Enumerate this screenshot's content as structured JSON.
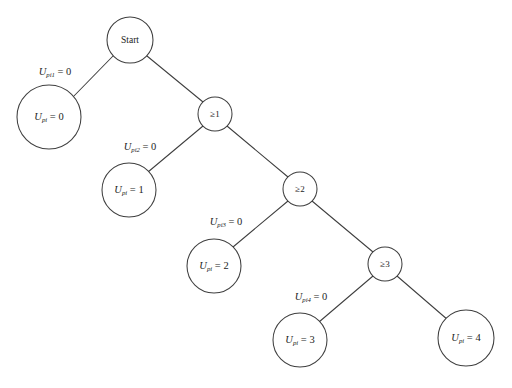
{
  "diagram": {
    "type": "decision-tree",
    "title": "",
    "background_color": "#ffffff",
    "stroke_color": "#3f3f3f",
    "text_color": "#1d1d1d",
    "root": {
      "id": "start",
      "label": "Start",
      "shape": "circle",
      "cx": 130,
      "cy": 40,
      "r": 23
    },
    "decision_nodes": [
      {
        "id": "ge1",
        "label": "≥1",
        "shape": "circle",
        "cx": 215,
        "cy": 114,
        "r": 17
      },
      {
        "id": "ge2",
        "label": "≥2",
        "shape": "circle",
        "cx": 300,
        "cy": 189,
        "r": 17
      },
      {
        "id": "ge3",
        "label": "≥3",
        "shape": "circle",
        "cx": 385,
        "cy": 264,
        "r": 17
      }
    ],
    "terminal_nodes": [
      {
        "id": "t0",
        "variable": "U",
        "subscript": "pi",
        "equals": " = 0",
        "value": "0",
        "shape": "circle",
        "cx": 49,
        "cy": 117,
        "r": 32
      },
      {
        "id": "t1",
        "variable": "U",
        "subscript": "pi",
        "equals": " = 1",
        "value": "1",
        "shape": "circle",
        "cx": 129,
        "cy": 190,
        "r": 27
      },
      {
        "id": "t2",
        "variable": "U",
        "subscript": "pi",
        "equals": " = 2",
        "value": "2",
        "shape": "circle",
        "cx": 214,
        "cy": 266,
        "r": 27
      },
      {
        "id": "t3",
        "variable": "U",
        "subscript": "pi",
        "equals": " = 3",
        "value": "3",
        "shape": "circle",
        "cx": 300,
        "cy": 340,
        "r": 27
      },
      {
        "id": "t4",
        "variable": "U",
        "subscript": "pi",
        "equals": " = 4",
        "value": "4",
        "shape": "circle",
        "cx": 466,
        "cy": 338,
        "r": 28
      }
    ],
    "edges": [
      {
        "id": "e-start-t0",
        "from": "start",
        "to": "t0",
        "x1": 113,
        "y1": 56,
        "x2": 72,
        "y2": 98
      },
      {
        "id": "e-start-ge1",
        "from": "start",
        "to": "ge1",
        "x1": 147,
        "y1": 56,
        "x2": 203,
        "y2": 102
      },
      {
        "id": "e-ge1-t1",
        "from": "ge1",
        "to": "t1",
        "x1": 203,
        "y1": 126,
        "x2": 148,
        "y2": 172
      },
      {
        "id": "e-ge1-ge2",
        "from": "ge1",
        "to": "ge2",
        "x1": 227,
        "y1": 126,
        "x2": 288,
        "y2": 177
      },
      {
        "id": "e-ge2-t2",
        "from": "ge2",
        "to": "t2",
        "x1": 288,
        "y1": 201,
        "x2": 233,
        "y2": 247
      },
      {
        "id": "e-ge2-ge3",
        "from": "ge2",
        "to": "ge3",
        "x1": 312,
        "y1": 201,
        "x2": 373,
        "y2": 252
      },
      {
        "id": "e-ge3-t3",
        "from": "ge3",
        "to": "t3",
        "x1": 373,
        "y1": 276,
        "x2": 319,
        "y2": 322
      },
      {
        "id": "e-ge3-t4",
        "from": "ge3",
        "to": "t4",
        "x1": 397,
        "y1": 276,
        "x2": 448,
        "y2": 320
      }
    ],
    "edge_labels": [
      {
        "id": "el1",
        "for_edge": "e-start-t0",
        "variable": "U",
        "subscript": "pi1",
        "equals": " = 0",
        "x": 55,
        "y": 73
      },
      {
        "id": "el2",
        "for_edge": "e-ge1-t1",
        "variable": "U",
        "subscript": "pi2",
        "equals": " = 0",
        "x": 140,
        "y": 148
      },
      {
        "id": "el3",
        "for_edge": "e-ge2-t2",
        "variable": "U",
        "subscript": "pi3",
        "equals": " = 0",
        "x": 226,
        "y": 223
      },
      {
        "id": "el4",
        "for_edge": "e-ge3-t3",
        "variable": "U",
        "subscript": "pi4",
        "equals": " = 0",
        "x": 311,
        "y": 298
      }
    ]
  }
}
